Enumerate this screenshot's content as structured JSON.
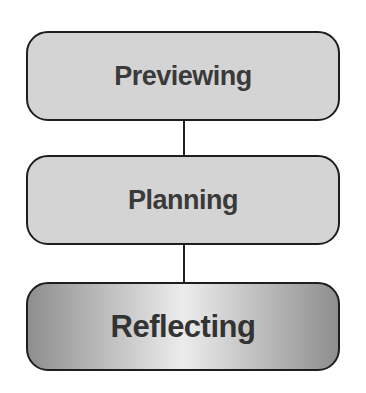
{
  "diagram": {
    "type": "vertical-flow",
    "steps": [
      {
        "label": "Previewing",
        "style": "plain"
      },
      {
        "label": "Planning",
        "style": "plain"
      },
      {
        "label": "Reflecting",
        "style": "gradient-highlight"
      }
    ],
    "colors": {
      "box_fill": "#d4d4d4",
      "border": "#1e1e1e",
      "text": "#3a3a3a",
      "highlight_gradient": [
        "#8e8e8e",
        "#ececec",
        "#8e8e8e"
      ]
    }
  }
}
